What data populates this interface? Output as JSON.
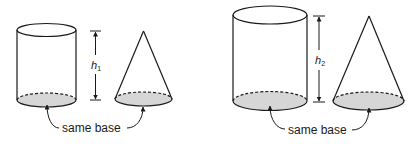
{
  "diagram": {
    "panels": [
      {
        "id": "panel-1",
        "height_label": "h",
        "height_subscript": "1",
        "base_label": "same base",
        "shapes": [
          "cylinder",
          "cone"
        ]
      },
      {
        "id": "panel-2",
        "height_label": "h",
        "height_subscript": "2",
        "base_label": "same base",
        "shapes": [
          "cylinder",
          "cone"
        ]
      }
    ],
    "colors": {
      "stroke": "#1a1a1a",
      "base_fill": "#d6d6d6",
      "background": "#ffffff"
    }
  }
}
